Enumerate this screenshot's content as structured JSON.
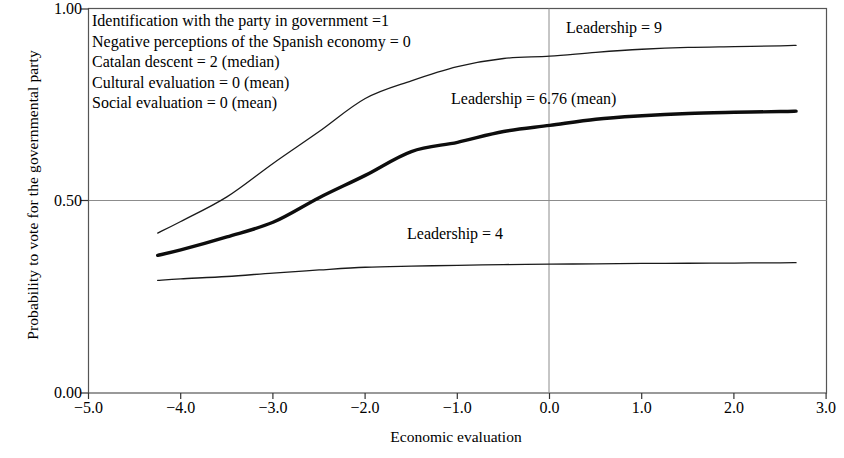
{
  "chart_data": {
    "type": "line",
    "title": "",
    "xlabel": "Economic evaluation",
    "ylabel": "Probability to vote for the governmental party",
    "xlim": [
      -5.0,
      3.0
    ],
    "ylim": [
      0.0,
      1.0
    ],
    "xticks": [
      "−5.0",
      "−4.0",
      "−3.0",
      "−2.0",
      "−1.0",
      "0.0",
      "1.0",
      "2.0",
      "3.0"
    ],
    "xtick_values": [
      -5.0,
      -4.0,
      -3.0,
      -2.0,
      -1.0,
      0.0,
      1.0,
      2.0,
      3.0
    ],
    "yticks": [
      "1.00",
      "0.50",
      "0.00"
    ],
    "ytick_values": [
      1.0,
      0.5,
      0.0
    ],
    "grid": "horizontal gridline at y=0.50; vertical gridline at x=0.0",
    "legend_position": "inline annotations next to each curve",
    "x": [
      -4.25,
      -4.0,
      -3.5,
      -3.0,
      -2.5,
      -2.0,
      -1.5,
      -1.0,
      -0.5,
      0.0,
      0.5,
      1.0,
      1.5,
      2.0,
      2.5,
      2.67
    ],
    "series": [
      {
        "name": "Leadership = 9",
        "label": "Leadership = 9",
        "linewidth": "thin",
        "color": "#1a1a1a",
        "values": [
          0.416,
          0.446,
          0.51,
          0.597,
          0.68,
          0.766,
          0.812,
          0.849,
          0.87,
          0.876,
          0.886,
          0.894,
          0.899,
          0.901,
          0.903,
          0.904
        ]
      },
      {
        "name": "Leadership = 6.76 (mean)",
        "label": "Leadership = 6.76 (mean)",
        "linewidth": "thick",
        "color": "#0d0d0d",
        "values": [
          0.358,
          0.372,
          0.406,
          0.444,
          0.508,
          0.566,
          0.628,
          0.652,
          0.68,
          0.696,
          0.712,
          0.721,
          0.727,
          0.73,
          0.732,
          0.733
        ]
      },
      {
        "name": "Leadership = 4",
        "label": "Leadership = 4",
        "linewidth": "thin",
        "color": "#1a1a1a",
        "values": [
          0.293,
          0.297,
          0.303,
          0.312,
          0.32,
          0.327,
          0.33,
          0.332,
          0.334,
          0.335,
          0.336,
          0.337,
          0.3375,
          0.338,
          0.3385,
          0.339
        ]
      }
    ],
    "annotations": [
      "Identification with the party in government =1",
      "Negative perceptions of the Spanish economy = 0",
      "Catalan descent = 2  (median)",
      "Cultural evaluation = 0  (mean)",
      "Social evaluation = 0  (mean)"
    ]
  },
  "axes": {
    "ylabel": "Probability to vote for the governmental party",
    "xlabel": "Economic evaluation",
    "ytick_top": "1.00",
    "ytick_mid": "0.50",
    "ytick_bottom": "0.00",
    "xticks": {
      "t0": "−5.0",
      "t1": "−4.0",
      "t2": "−3.0",
      "t3": "−2.0",
      "t4": "−1.0",
      "t5": "0.0",
      "t6": "1.0",
      "t7": "2.0",
      "t8": "3.0"
    }
  },
  "params": {
    "line1": "Identification with the party in government =1",
    "line2": "Negative perceptions of the Spanish economy = 0",
    "line3": "Catalan descent = 2  (median)",
    "line4": "Cultural evaluation = 0  (mean)",
    "line5": "Social evaluation = 0  (mean)"
  },
  "curve_labels": {
    "high": "Leadership = 9",
    "mean": "Leadership = 6.76 (mean)",
    "low": "Leadership = 4"
  },
  "colors": {
    "line": "#1a1a1a",
    "frame": "#4d4d4d",
    "gridline": "#808080",
    "background": "#ffffff"
  }
}
